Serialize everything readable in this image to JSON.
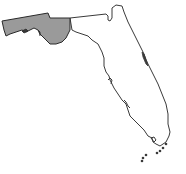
{
  "map": {
    "subject": "Florida",
    "highlighted_region": "Panhandle",
    "colors": {
      "background": "#ffffff",
      "outline": "#3a3a3a",
      "highlight_fill": "#9a9a9a",
      "land_fill": "#ffffff"
    }
  }
}
